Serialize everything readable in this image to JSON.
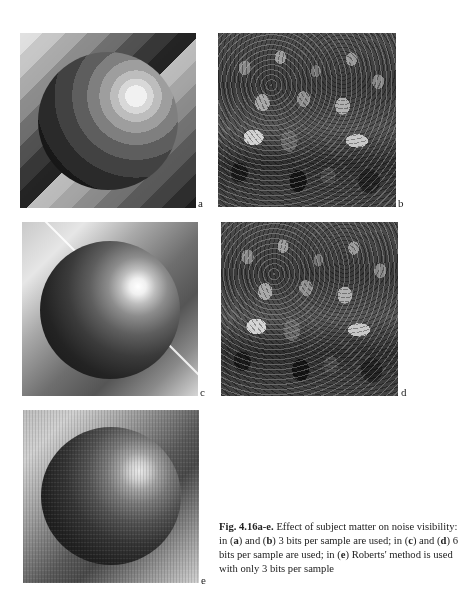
{
  "figure": {
    "panels": [
      {
        "id": "a",
        "label": "a",
        "description": "3-bit quantized shaded sphere (false contours)"
      },
      {
        "id": "b",
        "label": "b",
        "description": "3-bit crowd photograph"
      },
      {
        "id": "c",
        "label": "c",
        "description": "6-bit shaded sphere"
      },
      {
        "id": "d",
        "label": "d",
        "description": "6-bit crowd photograph"
      },
      {
        "id": "e",
        "label": "e",
        "description": "shaded sphere, Roberts' method, 3 bits"
      }
    ],
    "caption": {
      "figure_number": "Fig. 4.16a-e.",
      "line1_rest": " Effect of subject matter on noise visibility:",
      "line2_pre": "in (",
      "line2_a": "a",
      "line2_mid1": ") and (",
      "line2_b": "b",
      "line2_mid2": ") 3 bits per sample are used; in (",
      "line2_c": "c",
      "line2_mid3": ") and (",
      "line2_d": "d",
      "line2_post": ") 6",
      "line3_pre": "bits per sample are used; in (",
      "line3_e": "e",
      "line3_post": ") Roberts' method is used",
      "line4": "with only 3 bits per sample"
    }
  }
}
